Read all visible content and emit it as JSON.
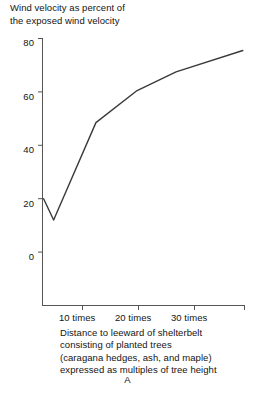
{
  "figure": {
    "panel_letter": "A",
    "axis_color": "#555555",
    "curve_color": "#3a3a3a",
    "background": "#ffffff"
  },
  "chart_data": {
    "type": "line",
    "title": "Wind velocity as percent of\nthe exposed wind velocity",
    "ylabel": "Wind velocity as percent of the exposed wind velocity",
    "xlabel": "Distance to leeward of shelterbelt\nconsisting of planted trees\n(caragana hedges, ash, and maple)\nexpressed as multiples of tree height",
    "xlim": [
      0,
      36.3
    ],
    "ylim": [
      0,
      100
    ],
    "ytick_values": [
      0,
      20,
      40,
      60,
      80,
      100
    ],
    "ytick_labels": [
      "0",
      "20",
      "40",
      "60",
      "80",
      "100"
    ],
    "xtick_values": [
      10,
      20,
      30
    ],
    "xtick_labels": [
      "10 times",
      "20 times",
      "30 times"
    ],
    "grid": false,
    "legend": false,
    "series": [
      {
        "name": "Wind velocity",
        "x": [
          0.2,
          2.0,
          9.6,
          17.0,
          24.0,
          36.0
        ],
        "y": [
          40.0,
          32.0,
          68.5,
          80.5,
          87.5,
          95.5
        ]
      }
    ]
  }
}
